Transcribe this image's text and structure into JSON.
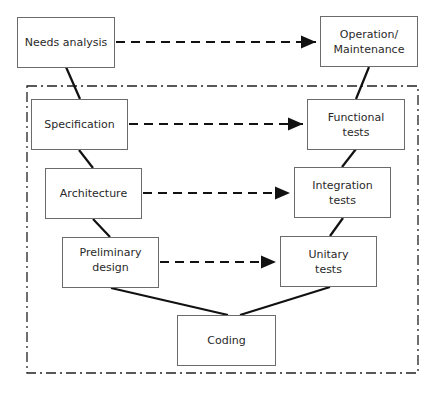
{
  "diagram": {
    "left_branch": [
      {
        "id": "needs",
        "label": "Needs analysis"
      },
      {
        "id": "spec",
        "label": "Specification"
      },
      {
        "id": "arch",
        "label": "Architecture"
      },
      {
        "id": "prelim",
        "label": "Preliminary\ndesign"
      }
    ],
    "bottom": {
      "id": "coding",
      "label": "Coding"
    },
    "right_branch": [
      {
        "id": "unit",
        "label": "Unitary\ntests"
      },
      {
        "id": "integ",
        "label": "Integration\ntests"
      },
      {
        "id": "func",
        "label": "Functional\ntests"
      },
      {
        "id": "ops",
        "label": "Operation/\nMaintenance"
      }
    ],
    "dashed_arrows": [
      {
        "from": "Needs analysis",
        "to": "Operation/Maintenance"
      },
      {
        "from": "Specification",
        "to": "Functional tests"
      },
      {
        "from": "Architecture",
        "to": "Integration tests"
      },
      {
        "from": "Preliminary design",
        "to": "Unitary tests"
      }
    ],
    "frame": "dash-dot boundary enclosing Specification through Functional tests",
    "colors": {
      "line": "#111111",
      "box_border": "#6b6b6b",
      "text": "#2a2a2a"
    }
  }
}
